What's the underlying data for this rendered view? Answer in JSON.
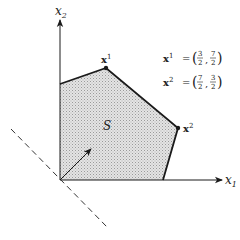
{
  "diagram": {
    "axes": {
      "x1": {
        "label": "x",
        "subscript": "1"
      },
      "x2": {
        "label": "x",
        "subscript": "2"
      }
    },
    "region": {
      "label": "S"
    },
    "vertices": [
      {
        "name": "x",
        "superscript": "1",
        "value": "(3/2, 7/2)"
      },
      {
        "name": "x",
        "superscript": "2",
        "value": "(7/2, 3/2)"
      }
    ],
    "equations": [
      {
        "lhs": "x",
        "sup": "1",
        "eq": "=",
        "open": "(",
        "a_num": "3",
        "a_den": "2",
        "sep": ",",
        "b_num": "7",
        "b_den": "2",
        "close": ")"
      },
      {
        "lhs": "x",
        "sup": "2",
        "eq": "=",
        "open": "(",
        "a_num": "7",
        "a_den": "2",
        "sep": ",",
        "b_num": "3",
        "b_den": "2",
        "close": ")"
      }
    ],
    "colors": {
      "line": "#1a1a1a",
      "fill": "#d9d9d9",
      "hatch": "#9a9a9a"
    }
  }
}
